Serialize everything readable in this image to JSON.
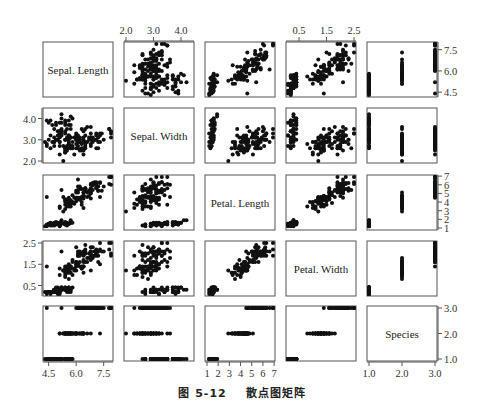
{
  "caption": {
    "figure_number": "图 5-12",
    "title": "散点图矩阵"
  },
  "chart_data": {
    "type": "scatter",
    "subtype": "scatter_matrix",
    "title": "散点图矩阵",
    "variables": [
      "Sepal. Length",
      "Sepal. Width",
      "Petal. Length",
      "Petal. Width",
      "Species"
    ],
    "ranges": {
      "Sepal. Length": [
        4.3,
        7.9
      ],
      "Sepal. Width": [
        2.0,
        4.4
      ],
      "Petal. Length": [
        1.0,
        6.9
      ],
      "Petal. Width": [
        0.1,
        2.5
      ],
      "Species": [
        1.0,
        3.0
      ]
    },
    "ticks": {
      "Sepal. Length": [
        "4.5",
        "6.0",
        "7.5"
      ],
      "Sepal. Width": [
        "2.0",
        "3.0",
        "4.0"
      ],
      "Petal. Length": [
        "1",
        "2",
        "3",
        "4",
        "5",
        "6",
        "7"
      ],
      "Petal. Width": [
        "0.5",
        "1.5",
        "2.5"
      ],
      "Species": [
        "1.0",
        "2.0",
        "3.0"
      ]
    },
    "tick_values": {
      "Sepal. Length": [
        4.5,
        6.0,
        7.5
      ],
      "Sepal. Width": [
        2.0,
        3.0,
        4.0
      ],
      "Petal. Length": [
        1,
        2,
        3,
        4,
        5,
        6,
        7
      ],
      "Petal. Width": [
        0.5,
        1.5,
        2.5
      ],
      "Species": [
        1.0,
        2.0,
        3.0
      ]
    },
    "axis_placement": {
      "top": [
        "Sepal. Width",
        "Petal. Width"
      ],
      "bottom": [
        "Sepal. Length",
        "Petal. Length",
        "Species"
      ],
      "left": [
        "Sepal. Width",
        "Petal. Width"
      ],
      "right": [
        "Sepal. Length",
        "Petal. Length",
        "Species"
      ]
    },
    "groups": [
      {
        "species": 1,
        "mean": [
          5.01,
          3.43,
          1.46,
          0.25
        ],
        "sd": [
          0.35,
          0.38,
          0.17,
          0.11
        ],
        "n": 50
      },
      {
        "species": 2,
        "mean": [
          5.94,
          2.77,
          4.26,
          1.33
        ],
        "sd": [
          0.52,
          0.31,
          0.47,
          0.2
        ],
        "n": 50
      },
      {
        "species": 3,
        "mean": [
          6.59,
          2.97,
          5.55,
          2.03
        ],
        "sd": [
          0.64,
          0.32,
          0.55,
          0.27
        ],
        "n": 50
      }
    ],
    "point_color": "#111111",
    "grid": false,
    "legend": null
  }
}
